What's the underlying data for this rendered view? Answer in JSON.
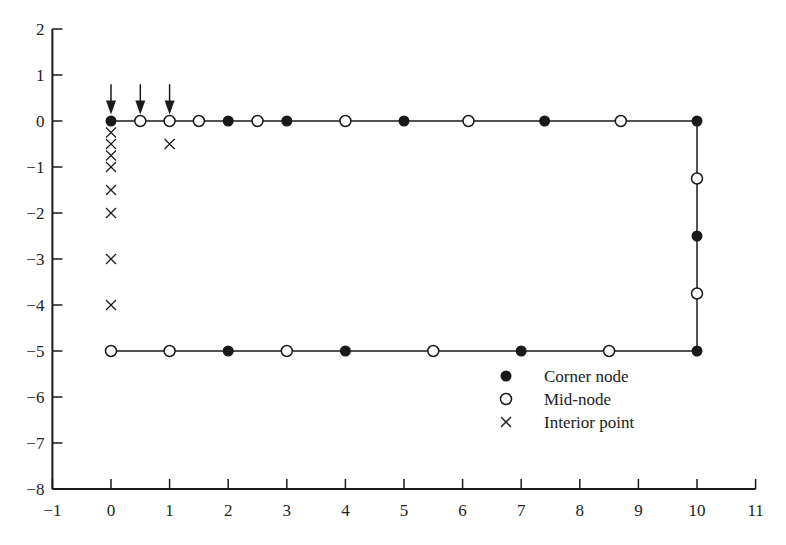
{
  "chart_data": {
    "type": "scatter",
    "title": "",
    "xlabel": "",
    "ylabel": "",
    "xlim": [
      -1,
      11
    ],
    "ylim": [
      -8,
      2
    ],
    "grid": false,
    "legend_position": "lower-right-inside",
    "x_ticks": [
      -1,
      0,
      1,
      2,
      3,
      4,
      5,
      6,
      7,
      8,
      9,
      10,
      11
    ],
    "y_ticks": [
      2,
      1,
      0,
      -1,
      -2,
      -3,
      -4,
      -5,
      -6,
      -7,
      -8
    ],
    "boundary": {
      "description": "Rectangular boundary outline (top, right, bottom edges)",
      "path": [
        [
          0,
          0
        ],
        [
          10,
          0
        ],
        [
          10,
          -5
        ],
        [
          0,
          -5
        ]
      ]
    },
    "series": [
      {
        "name": "Corner node",
        "marker": "filled-circle",
        "points": [
          [
            0,
            0
          ],
          [
            2,
            0
          ],
          [
            3,
            0
          ],
          [
            5,
            0
          ],
          [
            7.4,
            0
          ],
          [
            10,
            0
          ],
          [
            10,
            -2.5
          ],
          [
            10,
            -5
          ],
          [
            7,
            -5
          ],
          [
            4,
            -5
          ],
          [
            2,
            -5
          ]
        ]
      },
      {
        "name": "Mid-node",
        "marker": "open-circle",
        "points": [
          [
            0.5,
            0
          ],
          [
            1,
            0
          ],
          [
            1.5,
            0
          ],
          [
            2.5,
            0
          ],
          [
            4,
            0
          ],
          [
            6.1,
            0
          ],
          [
            8.7,
            0
          ],
          [
            10,
            -1.25
          ],
          [
            10,
            -3.75
          ],
          [
            8.5,
            -5
          ],
          [
            5.5,
            -5
          ],
          [
            3,
            -5
          ],
          [
            1,
            -5
          ],
          [
            0,
            -5
          ]
        ]
      },
      {
        "name": "Interior point",
        "marker": "x",
        "points": [
          [
            0,
            -0.25
          ],
          [
            0,
            -0.5
          ],
          [
            0,
            -0.75
          ],
          [
            0,
            -1
          ],
          [
            0,
            -1.5
          ],
          [
            0,
            -2
          ],
          [
            0,
            -3
          ],
          [
            0,
            -4
          ],
          [
            1,
            -0.5
          ]
        ]
      }
    ],
    "annotations": [
      {
        "type": "arrow-down",
        "x": 0,
        "y_from": 0.8,
        "y_to": 0.1
      },
      {
        "type": "arrow-down",
        "x": 0.5,
        "y_from": 0.8,
        "y_to": 0.1
      },
      {
        "type": "arrow-down",
        "x": 1,
        "y_from": 0.8,
        "y_to": 0.1
      }
    ]
  },
  "legend": {
    "items": [
      {
        "label": "Corner node",
        "marker": "filled-circle"
      },
      {
        "label": "Mid-node",
        "marker": "open-circle"
      },
      {
        "label": "Interior point",
        "marker": "x"
      }
    ]
  },
  "axes": {
    "x_tick_labels": [
      "−1",
      "0",
      "1",
      "2",
      "3",
      "4",
      "5",
      "6",
      "7",
      "8",
      "9",
      "10",
      "11"
    ],
    "y_tick_labels": [
      "2",
      "1",
      "0",
      "−1",
      "−2",
      "−3",
      "−4",
      "−5",
      "−6",
      "−7",
      "−8"
    ]
  },
  "colors": {
    "ink": "#1a1a1a",
    "background": "#ffffff"
  }
}
